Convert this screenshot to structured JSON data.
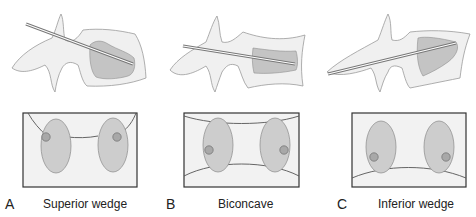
{
  "figure": {
    "panels": [
      {
        "letter": "A",
        "caption": "Superior wedge"
      },
      {
        "letter": "B",
        "caption": "Biconcave"
      },
      {
        "letter": "C",
        "caption": "Inferior wedge"
      }
    ],
    "colors": {
      "bone_fill": "#f0f0f0",
      "bone_outline": "#9a9a9a",
      "cement_fill": "#c4c4c4",
      "cement_outline": "#8e8e8e",
      "box_outline": "#333333",
      "pedicle_fill": "#cdcdcd",
      "pedicle_outline": "#8a8a8a",
      "dot_fill": "#a8a8a8",
      "dot_outline": "#6e6e6e",
      "needle": "#777777"
    }
  }
}
